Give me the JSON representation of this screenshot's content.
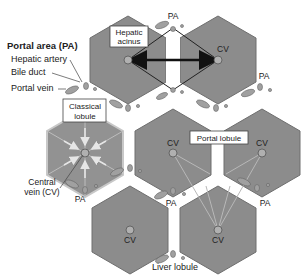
{
  "figure": {
    "title_label": "Portal area (PA)",
    "legend": {
      "hepatic_artery": "Hepatic artery",
      "bile_duct": "Bile duct",
      "portal_vein": "Portal vein"
    },
    "boxes": {
      "hepatic_acinus_line1": "Hepatic",
      "hepatic_acinus_line2": "acinus",
      "classical_lobule_line1": "Classical",
      "classical_lobule_line2": "lobule",
      "portal_lobule": "Portal lobule"
    },
    "central_vein_line1": "Central",
    "central_vein_line2": "vein (CV)",
    "cv_label": "CV",
    "pa_label": "PA",
    "caption": "Liver lobule",
    "colors": {
      "hexagon_fill": "#8c8c8c",
      "hexagon_stroke": "#6e6e6e",
      "classical_fill": "#999999",
      "vessel_fill": "#a8a8a8",
      "arrow": "#111111",
      "background": "#ffffff"
    },
    "hexagons": [
      {
        "id": "A",
        "cx": 128,
        "cy": 60
      },
      {
        "id": "B",
        "cx": 218,
        "cy": 60
      },
      {
        "id": "C",
        "cx": 85,
        "cy": 153
      },
      {
        "id": "D",
        "cx": 173,
        "cy": 153
      },
      {
        "id": "E",
        "cx": 262,
        "cy": 153
      },
      {
        "id": "F",
        "cx": 130,
        "cy": 230
      },
      {
        "id": "G",
        "cx": 218,
        "cy": 230
      }
    ]
  }
}
